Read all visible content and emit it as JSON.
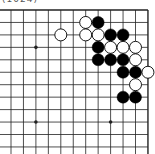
{
  "caption": "(1024)",
  "board": {
    "view": "top-right corner",
    "origin": {
      "x": 11,
      "y": 10
    },
    "spacing": 12.45,
    "columns": 12,
    "rows": 12,
    "left_open": true,
    "bottom_open": true,
    "hoshi": [
      [
        2,
        3
      ],
      [
        8,
        3
      ],
      [
        2,
        9
      ],
      [
        8,
        9
      ]
    ],
    "stones": [
      {
        "color": "white",
        "col": 6,
        "row": 1
      },
      {
        "color": "black",
        "col": 7,
        "row": 1
      },
      {
        "color": "white",
        "col": 4,
        "row": 2
      },
      {
        "color": "white",
        "col": 6,
        "row": 2
      },
      {
        "color": "white",
        "col": 7,
        "row": 2
      },
      {
        "color": "black",
        "col": 8,
        "row": 2
      },
      {
        "color": "black",
        "col": 9,
        "row": 2
      },
      {
        "color": "black",
        "col": 7,
        "row": 3
      },
      {
        "color": "white",
        "col": 8,
        "row": 3
      },
      {
        "color": "white",
        "col": 9,
        "row": 3
      },
      {
        "color": "white",
        "col": 10,
        "row": 3
      },
      {
        "color": "black",
        "col": 7,
        "row": 4
      },
      {
        "color": "black",
        "col": 8,
        "row": 4
      },
      {
        "color": "black",
        "col": 9,
        "row": 4
      },
      {
        "color": "white",
        "col": 10,
        "row": 4
      },
      {
        "color": "black",
        "col": 9,
        "row": 5
      },
      {
        "color": "black",
        "col": 10,
        "row": 5
      },
      {
        "color": "white",
        "col": 11,
        "row": 5
      },
      {
        "color": "white",
        "col": 10,
        "row": 6
      },
      {
        "color": "black",
        "col": 9,
        "row": 7
      },
      {
        "color": "black",
        "col": 10,
        "row": 7
      }
    ]
  },
  "colors": {
    "line": "#222222",
    "black_stone": "#000000",
    "white_stone": "#ffffff",
    "background": "#ffffff"
  }
}
